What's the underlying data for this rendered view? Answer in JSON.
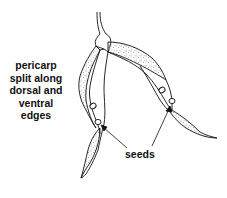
{
  "diagram": {
    "type": "botanical-illustration",
    "labels": {
      "pericarp": {
        "lines": [
          "pericarp",
          "split along",
          "dorsal and",
          "ventral",
          "edges"
        ]
      },
      "seeds": "seeds"
    },
    "colors": {
      "ink": "#111111",
      "background": "#ffffff",
      "stipple": "#333333"
    }
  }
}
